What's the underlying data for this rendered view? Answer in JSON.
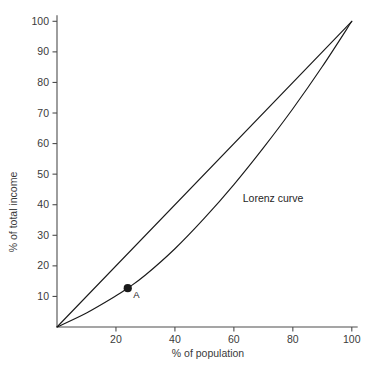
{
  "chart_data": {
    "type": "line",
    "title": "",
    "xlabel": "% of population",
    "ylabel": "% of total income",
    "xlim": [
      0,
      102
    ],
    "ylim": [
      0,
      102
    ],
    "grid": false,
    "legend_position": "inline-annotation",
    "xticks": [
      20,
      40,
      60,
      80,
      100
    ],
    "yticks": [
      10,
      20,
      30,
      40,
      50,
      60,
      70,
      80,
      90,
      100
    ],
    "xtick_labels": [
      "20",
      "40",
      "60",
      "80",
      "100"
    ],
    "ytick_labels": [
      "10",
      "20",
      "30",
      "40",
      "50",
      "60",
      "70",
      "80",
      "90",
      "100"
    ],
    "series": [
      {
        "name": "Line of equality",
        "kind": "line",
        "x": [
          0,
          100
        ],
        "values": [
          0,
          100
        ]
      },
      {
        "name": "Lorenz curve",
        "kind": "curve",
        "x": [
          0,
          10,
          20,
          24,
          30,
          40,
          50,
          60,
          70,
          80,
          90,
          100
        ],
        "values": [
          0,
          4.6,
          10.2,
          12.7,
          17.0,
          25.6,
          35.6,
          46.6,
          58.6,
          71.4,
          85.2,
          100
        ]
      }
    ],
    "annotations": [
      {
        "name": "lorenz-curve-label",
        "text": "Lorenz curve",
        "x": 63,
        "y": 41
      }
    ],
    "points": [
      {
        "name": "point-a",
        "label": "A",
        "x": 24,
        "y": 12.7,
        "marker": "filled-circle"
      }
    ],
    "colors": {
      "line": "#1a1a1a",
      "axis": "#4d4d4d",
      "tick_text": "#3a3a3a",
      "annotation_text": "#262626",
      "background": "#ffffff"
    }
  }
}
